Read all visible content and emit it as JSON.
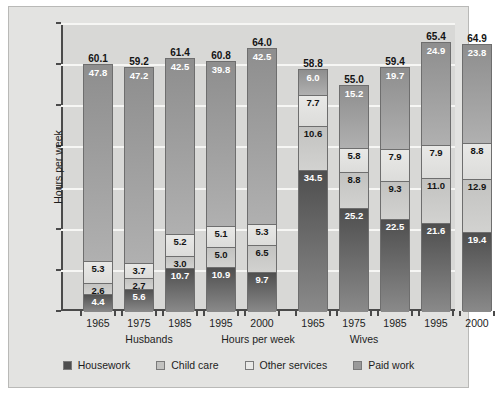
{
  "chart_data": {
    "type": "bar",
    "subtype": "stacked",
    "title": "",
    "xlabel": "Hours per week",
    "ylabel": "Hours per week",
    "ylim": [
      0,
      70
    ],
    "yticks": [
      0,
      10,
      20,
      30,
      40,
      50,
      60,
      70
    ],
    "grid": true,
    "legend_position": "bottom",
    "groups": [
      "Husbands",
      "Wives"
    ],
    "categories": [
      "1965",
      "1975",
      "1985",
      "1995",
      "2000"
    ],
    "series_order_bottom_to_top": [
      "Housework",
      "Child care",
      "Other services",
      "Paid work"
    ],
    "series": [
      {
        "name": "Housework",
        "color": "#4e4e4e",
        "husbands": [
          4.4,
          5.6,
          10.7,
          10.9,
          9.7
        ],
        "wives": [
          34.5,
          25.2,
          22.5,
          21.6,
          19.4
        ]
      },
      {
        "name": "Child care",
        "color": "#c2c2c0",
        "husbands": [
          2.6,
          2.7,
          3.0,
          5.0,
          6.5
        ],
        "wives": [
          10.6,
          8.8,
          9.3,
          11.0,
          12.9
        ]
      },
      {
        "name": "Other services",
        "color": "#e9e9e7",
        "husbands": [
          5.3,
          3.7,
          5.2,
          5.1,
          5.3
        ],
        "wives": [
          7.7,
          5.8,
          7.9,
          7.9,
          8.8
        ]
      },
      {
        "name": "Paid work",
        "color": "#9a9a9a",
        "husbands": [
          47.8,
          47.2,
          42.5,
          39.8,
          42.5
        ],
        "wives": [
          6.0,
          15.2,
          19.7,
          24.9,
          23.8
        ]
      }
    ],
    "totals": {
      "husbands": [
        60.1,
        59.2,
        61.4,
        60.8,
        64.0
      ],
      "wives": [
        58.8,
        55.0,
        59.4,
        65.4,
        64.9
      ]
    }
  },
  "axis": {
    "y_label": "Hours per week",
    "x_label": "Hours per week",
    "y_ticks": [
      "70",
      "60",
      "50",
      "40",
      "30",
      "20",
      "10",
      "0"
    ]
  },
  "groups": {
    "husbands_label": "Husbands",
    "wives_label": "Wives"
  },
  "legend": {
    "items": [
      {
        "label": "Housework",
        "color": "#4e4e4e"
      },
      {
        "label": "Child care",
        "color": "#c2c2c0"
      },
      {
        "label": "Other services",
        "color": "#e9e9e7"
      },
      {
        "label": "Paid work",
        "color": "#9a9a9a"
      }
    ]
  }
}
